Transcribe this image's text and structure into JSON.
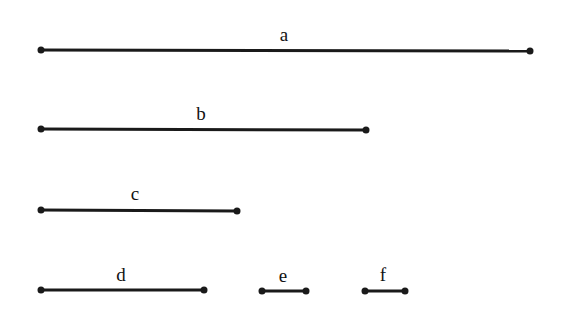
{
  "diagram": {
    "segments": [
      {
        "id": "a",
        "label": "a"
      },
      {
        "id": "b",
        "label": "b"
      },
      {
        "id": "c",
        "label": "c"
      },
      {
        "id": "d",
        "label": "d"
      },
      {
        "id": "e",
        "label": "e"
      },
      {
        "id": "f",
        "label": "f"
      }
    ]
  }
}
